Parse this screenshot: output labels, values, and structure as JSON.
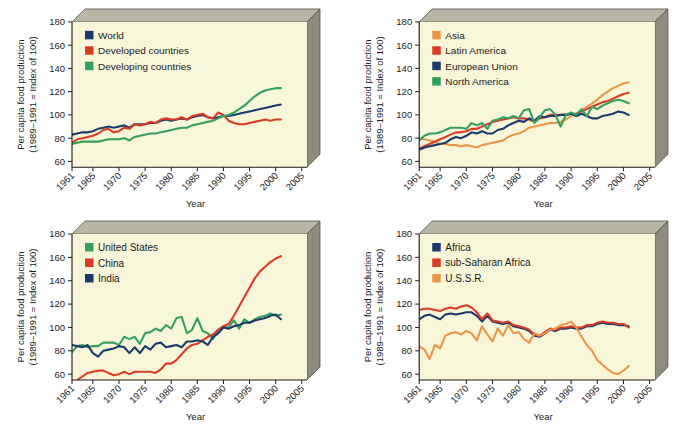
{
  "figure": {
    "background": "#ffffff",
    "plot_face_color": "#f8f6d8",
    "plot_top_color": "#b8b6a4",
    "plot_side_color": "#8e8c7c",
    "axis_color": "#1a1a1a"
  },
  "axes": {
    "ylabel_line1": "Per capita food production",
    "ylabel_line2": "(1989–1991 = Index of 100)",
    "xlabel": "Year",
    "ytick_labels": [
      "60",
      "80",
      "100",
      "120",
      "140",
      "160",
      "180"
    ],
    "ytick_values": [
      60,
      80,
      100,
      120,
      140,
      160,
      180
    ],
    "xtick_labels": [
      "1961",
      "1965",
      "1970",
      "1975",
      "1980",
      "1985",
      "1990",
      "1995",
      "2000",
      "2005"
    ],
    "xtick_values": [
      1961,
      1965,
      1970,
      1975,
      1980,
      1985,
      1990,
      1995,
      2000,
      2005
    ],
    "ylim": [
      55,
      180
    ],
    "xlim": [
      1961,
      2006
    ],
    "grid": false
  },
  "colors": {
    "navy": "#1b3a6b",
    "red": "#d93b24",
    "green": "#34a060",
    "orange": "#e8974a"
  },
  "chart_data": [
    {
      "type": "line",
      "panel": "top-left",
      "title": "",
      "xlabel": "Year",
      "ylabel": "Per capita food production (1989-1991 = Index of 100)",
      "ylim": [
        55,
        180
      ],
      "xlim": [
        1961,
        2006
      ],
      "grid": false,
      "legend_position": "upper-left",
      "x": [
        1961,
        1962,
        1963,
        1964,
        1965,
        1966,
        1967,
        1968,
        1969,
        1970,
        1971,
        1972,
        1973,
        1974,
        1975,
        1976,
        1977,
        1978,
        1979,
        1980,
        1981,
        1982,
        1983,
        1984,
        1985,
        1986,
        1987,
        1988,
        1989,
        1990,
        1991,
        1992,
        1993,
        1994,
        1995,
        1996,
        1997,
        1998,
        1999,
        2000,
        2001
      ],
      "series": [
        {
          "name": "World",
          "color": "#1b3a6b",
          "values": [
            83,
            84,
            85,
            85,
            86,
            88,
            89,
            90,
            89,
            90,
            91,
            89,
            92,
            92,
            92,
            93,
            93,
            95,
            96,
            95,
            96,
            97,
            96,
            98,
            99,
            100,
            98,
            97,
            98,
            99,
            99,
            100,
            101,
            102,
            103,
            104,
            105,
            106,
            107,
            108,
            109
          ]
        },
        {
          "name": "Developed countries",
          "color": "#d93b24",
          "values": [
            76,
            79,
            80,
            81,
            82,
            84,
            87,
            88,
            85,
            86,
            89,
            88,
            92,
            91,
            92,
            94,
            93,
            96,
            97,
            96,
            96,
            98,
            96,
            99,
            100,
            101,
            98,
            97,
            102,
            100,
            95,
            93,
            92,
            92,
            93,
            94,
            95,
            96,
            95,
            96,
            96
          ]
        },
        {
          "name": "Developing countries",
          "color": "#34a060",
          "values": [
            75,
            76,
            77,
            77,
            77,
            77,
            78,
            79,
            79,
            79,
            80,
            78,
            81,
            82,
            83,
            84,
            84,
            85,
            86,
            87,
            88,
            89,
            89,
            91,
            92,
            93,
            94,
            95,
            97,
            99,
            100,
            102,
            105,
            108,
            112,
            116,
            119,
            121,
            122,
            123,
            123
          ]
        }
      ]
    },
    {
      "type": "line",
      "panel": "top-right",
      "title": "",
      "xlabel": "Year",
      "ylabel": "Per capita food production (1989-1991 = Index of 100)",
      "ylim": [
        55,
        180
      ],
      "xlim": [
        1961,
        2006
      ],
      "grid": false,
      "legend_position": "upper-left",
      "x": [
        1961,
        1962,
        1963,
        1964,
        1965,
        1966,
        1967,
        1968,
        1969,
        1970,
        1971,
        1972,
        1973,
        1974,
        1975,
        1976,
        1977,
        1978,
        1979,
        1980,
        1981,
        1982,
        1983,
        1984,
        1985,
        1986,
        1987,
        1988,
        1989,
        1990,
        1991,
        1992,
        1993,
        1994,
        1995,
        1996,
        1997,
        1998,
        1999,
        2000,
        2001
      ],
      "series": [
        {
          "name": "Asia",
          "color": "#e8974a",
          "values": [
            80,
            79,
            78,
            77,
            75,
            75,
            74,
            74,
            73,
            74,
            73,
            72,
            74,
            75,
            76,
            77,
            78,
            81,
            83,
            84,
            86,
            89,
            90,
            91,
            92,
            93,
            93,
            94,
            96,
            99,
            101,
            104,
            107,
            110,
            113,
            117,
            120,
            123,
            125,
            127,
            128
          ]
        },
        {
          "name": "Latin America",
          "color": "#d93b24",
          "values": [
            71,
            73,
            75,
            77,
            79,
            81,
            83,
            85,
            85,
            86,
            88,
            88,
            90,
            92,
            94,
            95,
            96,
            97,
            98,
            97,
            97,
            96,
            94,
            97,
            98,
            100,
            100,
            100,
            100,
            101,
            101,
            103,
            105,
            107,
            109,
            111,
            112,
            114,
            116,
            118,
            119
          ]
        },
        {
          "name": "European Union",
          "color": "#1b3a6b",
          "values": [
            70,
            72,
            73,
            74,
            75,
            76,
            79,
            81,
            80,
            82,
            85,
            84,
            86,
            84,
            84,
            87,
            88,
            91,
            93,
            95,
            94,
            97,
            95,
            99,
            98,
            99,
            99,
            100,
            100,
            101,
            99,
            101,
            99,
            97,
            97,
            99,
            100,
            101,
            103,
            102,
            100
          ]
        },
        {
          "name": "North America",
          "color": "#34a060",
          "values": [
            78,
            82,
            84,
            84,
            85,
            87,
            89,
            89,
            89,
            88,
            93,
            91,
            93,
            88,
            95,
            96,
            98,
            97,
            99,
            97,
            104,
            105,
            93,
            98,
            104,
            105,
            100,
            90,
            100,
            102,
            100,
            105,
            99,
            107,
            105,
            108,
            110,
            112,
            113,
            112,
            110
          ]
        }
      ]
    },
    {
      "type": "line",
      "panel": "bottom-left",
      "title": "",
      "xlabel": "Year",
      "ylabel": "Per capita food production (1989-1991 = Index of 100)",
      "ylim": [
        55,
        180
      ],
      "xlim": [
        1961,
        2006
      ],
      "grid": false,
      "legend_position": "upper-left",
      "x": [
        1961,
        1962,
        1963,
        1964,
        1965,
        1966,
        1967,
        1968,
        1969,
        1970,
        1971,
        1972,
        1973,
        1974,
        1975,
        1976,
        1977,
        1978,
        1979,
        1980,
        1981,
        1982,
        1983,
        1984,
        1985,
        1986,
        1987,
        1988,
        1989,
        1990,
        1991,
        1992,
        1993,
        1994,
        1995,
        1996,
        1997,
        1998,
        1999,
        2000,
        2001
      ],
      "series": [
        {
          "name": "United States",
          "color": "#34a060",
          "values": [
            79,
            84,
            85,
            83,
            84,
            84,
            87,
            87,
            87,
            85,
            92,
            90,
            92,
            86,
            95,
            96,
            99,
            97,
            102,
            99,
            108,
            109,
            95,
            98,
            108,
            97,
            95,
            90,
            98,
            101,
            100,
            106,
            99,
            107,
            104,
            107,
            109,
            110,
            112,
            110,
            111
          ]
        },
        {
          "name": "China",
          "color": "#d93b24",
          "values": [
            52,
            55,
            58,
            61,
            62,
            63,
            63,
            61,
            59,
            60,
            62,
            60,
            62,
            62,
            62,
            62,
            61,
            64,
            69,
            69,
            72,
            77,
            82,
            85,
            86,
            89,
            92,
            94,
            98,
            101,
            103,
            110,
            118,
            126,
            134,
            142,
            148,
            152,
            156,
            159,
            161
          ]
        },
        {
          "name": "India",
          "color": "#1b3a6b",
          "values": [
            85,
            84,
            83,
            85,
            78,
            75,
            80,
            81,
            82,
            84,
            83,
            78,
            83,
            78,
            84,
            81,
            86,
            87,
            83,
            84,
            85,
            83,
            88,
            88,
            89,
            88,
            85,
            92,
            95,
            100,
            99,
            101,
            102,
            104,
            104,
            106,
            107,
            108,
            110,
            111,
            107
          ]
        }
      ]
    },
    {
      "type": "line",
      "panel": "bottom-right",
      "title": "",
      "xlabel": "Year",
      "ylabel": "Per capita food production (1989-1991 = Index of 100)",
      "ylim": [
        55,
        180
      ],
      "xlim": [
        1961,
        2006
      ],
      "grid": false,
      "legend_position": "upper-left",
      "x": [
        1961,
        1962,
        1963,
        1964,
        1965,
        1966,
        1967,
        1968,
        1969,
        1970,
        1971,
        1972,
        1973,
        1974,
        1975,
        1976,
        1977,
        1978,
        1979,
        1980,
        1981,
        1982,
        1983,
        1984,
        1985,
        1986,
        1987,
        1988,
        1989,
        1990,
        1991,
        1992,
        1993,
        1994,
        1995,
        1996,
        1997,
        1998,
        1999,
        2000,
        2001
      ],
      "series": [
        {
          "name": "Africa",
          "color": "#1b3a6b",
          "values": [
            107,
            110,
            111,
            109,
            107,
            111,
            112,
            111,
            112,
            113,
            113,
            110,
            105,
            110,
            105,
            104,
            103,
            104,
            101,
            100,
            99,
            97,
            93,
            92,
            95,
            98,
            97,
            99,
            99,
            100,
            99,
            99,
            101,
            101,
            103,
            104,
            103,
            103,
            102,
            102,
            101
          ]
        },
        {
          "name": "sub-Saharan Africa",
          "color": "#d93b24",
          "values": [
            115,
            116,
            116,
            115,
            114,
            116,
            117,
            116,
            118,
            119,
            117,
            113,
            107,
            112,
            106,
            105,
            104,
            105,
            102,
            101,
            100,
            98,
            94,
            93,
            96,
            99,
            98,
            100,
            100,
            101,
            100,
            100,
            102,
            102,
            104,
            105,
            104,
            104,
            103,
            103,
            100
          ]
        },
        {
          "name": "U.S.S.R.",
          "color": "#e8974a",
          "values": [
            84,
            81,
            73,
            85,
            82,
            93,
            95,
            96,
            94,
            97,
            95,
            89,
            101,
            94,
            88,
            99,
            93,
            102,
            95,
            96,
            90,
            87,
            95,
            93,
            95,
            98,
            99,
            102,
            103,
            105,
            100,
            92,
            85,
            80,
            72,
            68,
            64,
            61,
            60,
            63,
            67
          ]
        }
      ]
    }
  ],
  "panels": [
    {
      "id": "panel-top-left",
      "legend": [
        {
          "label": "World",
          "color": "#1b3a6b"
        },
        {
          "label": "Developed countries",
          "color": "#d93b24"
        },
        {
          "label": "Developing countries",
          "color": "#34a060"
        }
      ]
    },
    {
      "id": "panel-top-right",
      "legend": [
        {
          "label": "Asia",
          "color": "#e8974a"
        },
        {
          "label": "Latin America",
          "color": "#d93b24"
        },
        {
          "label": "European Union",
          "color": "#1b3a6b"
        },
        {
          "label": "North America",
          "color": "#34a060"
        }
      ]
    },
    {
      "id": "panel-bottom-left",
      "legend": [
        {
          "label": "United States",
          "color": "#34a060"
        },
        {
          "label": "China",
          "color": "#d93b24"
        },
        {
          "label": "India",
          "color": "#1b3a6b"
        }
      ]
    },
    {
      "id": "panel-bottom-right",
      "legend": [
        {
          "label": "Africa",
          "color": "#1b3a6b"
        },
        {
          "label": "sub-Saharan Africa",
          "color": "#d93b24"
        },
        {
          "label": "U.S.S.R.",
          "color": "#e8974a"
        }
      ]
    }
  ]
}
